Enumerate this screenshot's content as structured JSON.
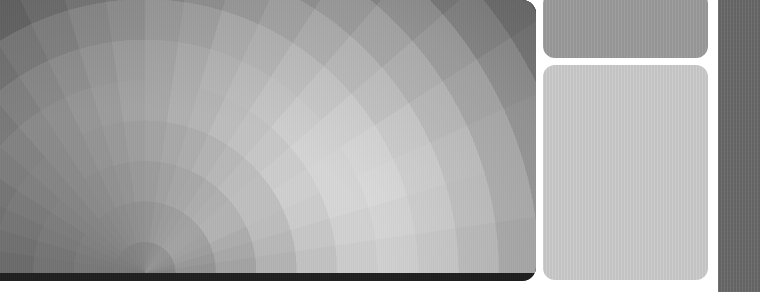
{
  "app": {
    "title": "Radial Sector Heatmap Viewer",
    "canvas_label": "radial-heatmap",
    "background_color": "#ffffff"
  },
  "layout": {
    "width": 760,
    "height": 292,
    "heatmap_panel": {
      "x": 0,
      "y": 0,
      "width": 536,
      "height": 281,
      "corner_radius": 14
    },
    "side_panel_top": {
      "x": 543,
      "y": -8,
      "width": 165,
      "height": 66,
      "corner_radius": 12
    },
    "side_panel_main": {
      "x": 543,
      "y": 65,
      "width": 165,
      "height": 215,
      "corner_radius": 12
    },
    "right_rail": {
      "x": 718,
      "y": 0,
      "width": 42,
      "height": 292
    }
  },
  "colors": {
    "heatmap_darkest": "#1e1e1e",
    "heatmap_dark": "#3a3a3a",
    "heatmap_mid": "#8a8a8a",
    "heatmap_light": "#c2c2c2",
    "heatmap_lightest": "#d6d6d6",
    "side_panel_top": "#9a9a9a",
    "side_panel_main": "#cacaca",
    "right_rail": "#6a6a6a",
    "gutter": "#ffffff"
  },
  "panels": {
    "top_tile": {
      "name": "side-panel-top",
      "fill": "#9a9a9a",
      "content": ""
    },
    "main_tile": {
      "name": "side-panel-main",
      "fill": "#cacaca",
      "content": ""
    },
    "rail": {
      "name": "right-rail",
      "fill": "#6a6a6a",
      "content": ""
    }
  },
  "chart_data": {
    "type": "heatmap",
    "subtype": "polar-sector",
    "title": "",
    "xlabel": "",
    "ylabel": "",
    "grid": false,
    "legend": "none",
    "center": {
      "x": 0.27,
      "y": 0.97
    },
    "radial_rings": 13,
    "angular_sectors": 22,
    "angle_range_deg": [
      0,
      180
    ],
    "radius_range": [
      0.0,
      1.0
    ],
    "value_range": [
      0.08,
      0.86
    ],
    "colormap": "gray",
    "rings": [
      {
        "r": 0.06,
        "values": [
          0.52,
          0.54,
          0.56,
          0.57,
          0.58,
          0.58,
          0.58,
          0.57,
          0.56,
          0.55,
          0.54,
          0.53,
          0.52,
          0.52,
          0.51,
          0.51,
          0.5,
          0.5,
          0.49,
          0.49,
          0.48,
          0.48
        ]
      },
      {
        "r": 0.14,
        "values": [
          0.58,
          0.6,
          0.62,
          0.63,
          0.64,
          0.64,
          0.63,
          0.62,
          0.61,
          0.6,
          0.58,
          0.57,
          0.56,
          0.55,
          0.54,
          0.53,
          0.52,
          0.51,
          0.5,
          0.49,
          0.48,
          0.47
        ]
      },
      {
        "r": 0.22,
        "values": [
          0.64,
          0.66,
          0.68,
          0.7,
          0.7,
          0.69,
          0.68,
          0.66,
          0.65,
          0.63,
          0.61,
          0.6,
          0.58,
          0.57,
          0.55,
          0.54,
          0.52,
          0.51,
          0.49,
          0.48,
          0.46,
          0.45
        ]
      },
      {
        "r": 0.3,
        "values": [
          0.7,
          0.72,
          0.74,
          0.75,
          0.75,
          0.74,
          0.72,
          0.7,
          0.68,
          0.66,
          0.64,
          0.62,
          0.6,
          0.58,
          0.56,
          0.54,
          0.52,
          0.5,
          0.48,
          0.46,
          0.44,
          0.42
        ]
      },
      {
        "r": 0.38,
        "values": [
          0.76,
          0.78,
          0.8,
          0.81,
          0.8,
          0.78,
          0.76,
          0.74,
          0.71,
          0.69,
          0.66,
          0.64,
          0.61,
          0.59,
          0.56,
          0.54,
          0.51,
          0.49,
          0.46,
          0.44,
          0.41,
          0.39
        ]
      },
      {
        "r": 0.46,
        "values": [
          0.8,
          0.82,
          0.84,
          0.84,
          0.83,
          0.81,
          0.78,
          0.75,
          0.72,
          0.69,
          0.66,
          0.63,
          0.6,
          0.57,
          0.54,
          0.51,
          0.48,
          0.45,
          0.42,
          0.39,
          0.36,
          0.34
        ]
      },
      {
        "r": 0.54,
        "values": [
          0.82,
          0.84,
          0.86,
          0.85,
          0.83,
          0.8,
          0.77,
          0.73,
          0.7,
          0.66,
          0.63,
          0.59,
          0.56,
          0.52,
          0.49,
          0.46,
          0.42,
          0.39,
          0.36,
          0.33,
          0.3,
          0.28
        ]
      },
      {
        "r": 0.62,
        "values": [
          0.8,
          0.82,
          0.83,
          0.82,
          0.79,
          0.76,
          0.72,
          0.68,
          0.64,
          0.6,
          0.56,
          0.52,
          0.49,
          0.45,
          0.41,
          0.38,
          0.35,
          0.32,
          0.29,
          0.26,
          0.24,
          0.22
        ]
      },
      {
        "r": 0.7,
        "values": [
          0.76,
          0.78,
          0.79,
          0.77,
          0.74,
          0.7,
          0.66,
          0.61,
          0.57,
          0.53,
          0.49,
          0.45,
          0.41,
          0.38,
          0.34,
          0.31,
          0.28,
          0.25,
          0.23,
          0.21,
          0.19,
          0.17
        ]
      },
      {
        "r": 0.78,
        "values": [
          0.7,
          0.72,
          0.72,
          0.7,
          0.67,
          0.63,
          0.58,
          0.54,
          0.49,
          0.45,
          0.41,
          0.37,
          0.34,
          0.3,
          0.27,
          0.25,
          0.22,
          0.2,
          0.18,
          0.16,
          0.15,
          0.14
        ]
      },
      {
        "r": 0.86,
        "values": [
          0.62,
          0.64,
          0.64,
          0.62,
          0.58,
          0.54,
          0.5,
          0.45,
          0.41,
          0.37,
          0.33,
          0.3,
          0.27,
          0.24,
          0.22,
          0.2,
          0.18,
          0.16,
          0.15,
          0.13,
          0.12,
          0.11
        ]
      },
      {
        "r": 0.93,
        "values": [
          0.54,
          0.55,
          0.55,
          0.53,
          0.5,
          0.46,
          0.42,
          0.38,
          0.34,
          0.3,
          0.27,
          0.24,
          0.22,
          0.2,
          0.18,
          0.16,
          0.14,
          0.13,
          0.12,
          0.11,
          0.1,
          0.09
        ]
      },
      {
        "r": 1.0,
        "values": [
          0.46,
          0.47,
          0.47,
          0.45,
          0.42,
          0.38,
          0.34,
          0.31,
          0.27,
          0.24,
          0.22,
          0.19,
          0.17,
          0.16,
          0.14,
          0.13,
          0.12,
          0.11,
          0.1,
          0.09,
          0.09,
          0.08
        ]
      }
    ]
  }
}
